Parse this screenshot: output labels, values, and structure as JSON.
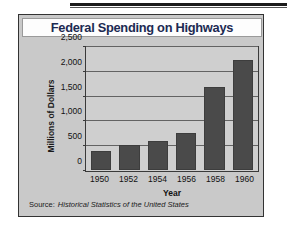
{
  "figure": {
    "title": "Federal Spending on Highways",
    "source_label": "Source:",
    "source_text": "Historical Statistics of the United States"
  },
  "colors": {
    "title": "#1c2a52",
    "bar": "#4a4a4a",
    "plot_background": "#cfcfcf",
    "card_background": "#c9c9c9",
    "axis": "#3a3a3a"
  },
  "chart_data": {
    "type": "bar",
    "title": "Federal Spending on Highways",
    "subtitle": "",
    "xlabel": "Year",
    "ylabel": "Millions of Dollars",
    "categories": [
      "1950",
      "1952",
      "1954",
      "1956",
      "1958",
      "1960"
    ],
    "values": [
      380,
      520,
      590,
      750,
      1700,
      2250
    ],
    "ylim": [
      0,
      2500
    ],
    "ytick_labels": [
      "0",
      "500",
      "1,000",
      "1,500",
      "2,000",
      "2,500"
    ],
    "ytick_values": [
      0,
      500,
      1000,
      1500,
      2000,
      2500
    ],
    "grid": true,
    "legend": "none",
    "annotations": [
      "Source: Historical Statistics of the United States"
    ]
  }
}
